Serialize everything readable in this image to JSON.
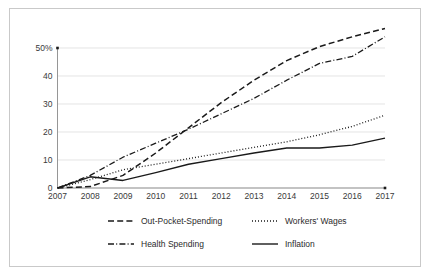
{
  "chart_data": {
    "type": "line",
    "title": "",
    "subtitle": "",
    "xlabel": "",
    "ylabel": "",
    "x": [
      2007,
      2008,
      2009,
      2010,
      2011,
      2012,
      2013,
      2014,
      2015,
      2016,
      2017
    ],
    "categories": [
      "2007",
      "2008",
      "2009",
      "2010",
      "2011",
      "2012",
      "2013",
      "2014",
      "2015",
      "2016",
      "2017"
    ],
    "xlim": [
      2007,
      2017
    ],
    "ylim": [
      0,
      50
    ],
    "yticks": [
      0,
      10,
      20,
      30,
      40,
      50
    ],
    "ytick_labels": [
      "0",
      "10",
      "20",
      "30",
      "40",
      "50%"
    ],
    "grid": true,
    "legend_position": "bottom",
    "series": [
      {
        "name": "Out-Pocket-Spending",
        "style": "dashed",
        "color": "#1a1a1a",
        "values": [
          0,
          0.5,
          4.5,
          12.5,
          21.5,
          30.5,
          38.5,
          45.5,
          50.5,
          54.0,
          57.0
        ]
      },
      {
        "name": "Workers' Wages",
        "style": "dotted",
        "color": "#1a1a1a",
        "values": [
          0,
          3.0,
          6.5,
          8.5,
          10.5,
          12.5,
          14.5,
          16.5,
          19.0,
          22.0,
          26.0
        ]
      },
      {
        "name": "Health Spending",
        "style": "dashdot",
        "color": "#1a1a1a",
        "values": [
          0,
          4.5,
          11.0,
          16.0,
          21.0,
          26.5,
          32.0,
          38.5,
          44.5,
          47.0,
          54.0
        ]
      },
      {
        "name": "Inflation",
        "style": "solid",
        "color": "#1a1a1a",
        "values": [
          0,
          4.0,
          2.7,
          5.5,
          8.5,
          10.5,
          12.5,
          14.3,
          14.3,
          15.3,
          17.8
        ]
      }
    ]
  },
  "axis": {
    "y_tick_labels": [
      "50%",
      "40",
      "30",
      "20",
      "10",
      "0"
    ],
    "x_tick_labels": [
      "2007",
      "2008",
      "2009",
      "2010",
      "2011",
      "2012",
      "2013",
      "2014",
      "2015",
      "2016",
      "2017"
    ]
  },
  "legend": {
    "items": [
      {
        "label": "Out-Pocket-Spending",
        "style": "dashed"
      },
      {
        "label": "Workers' Wages",
        "style": "dotted"
      },
      {
        "label": "Health Spending",
        "style": "dashdot"
      },
      {
        "label": "Inflation",
        "style": "solid"
      }
    ]
  },
  "colors": {
    "line": "#1a1a1a",
    "grid": "#d8d8d8",
    "axis": "#8a8a8a",
    "frame": "#c9c9c9",
    "background": "#ffffff",
    "text": "#3a3a3a"
  }
}
